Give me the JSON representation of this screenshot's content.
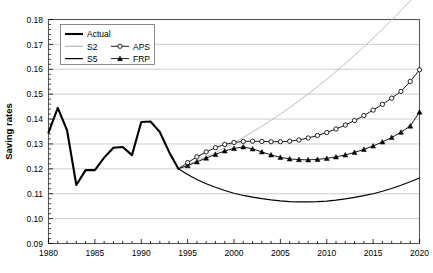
{
  "chart_data": {
    "type": "line",
    "title": "",
    "xlabel": "",
    "ylabel": "Saving rates",
    "xlim": [
      1980,
      2020
    ],
    "ylim": [
      0.09,
      0.18
    ],
    "xticks": [
      1980,
      1985,
      1990,
      1995,
      2000,
      2005,
      2010,
      2015,
      2020
    ],
    "xtick_labels": [
      "1980",
      "1985",
      "1990",
      "1995",
      "2000",
      "2005",
      "2010",
      "2015",
      "2020"
    ],
    "x_minor_tick_step": 1,
    "yticks": [
      0.09,
      0.1,
      0.11,
      0.12,
      0.13,
      0.14,
      0.15,
      0.16,
      0.17,
      0.18
    ],
    "ytick_labels": [
      "0.09",
      "0.10",
      "0.11",
      "0.12",
      "0.13",
      "0.14",
      "0.15",
      "0.16",
      "0.17",
      "0.18"
    ],
    "grid": "horizontal",
    "legend_position": "top-left",
    "series": [
      {
        "name": "Actual",
        "style": "thick-solid",
        "color": "#000000",
        "width": 2.1,
        "marker": "none",
        "x": [
          1980,
          1981,
          1982,
          1983,
          1984,
          1985,
          1986,
          1987,
          1988,
          1989,
          1990,
          1991,
          1992,
          1993,
          1994
        ],
        "y": [
          0.1345,
          0.1445,
          0.1355,
          0.1135,
          0.1195,
          0.1195,
          0.1245,
          0.1285,
          0.1288,
          0.1255,
          0.1388,
          0.139,
          0.1348,
          0.1268,
          0.12
        ]
      },
      {
        "name": "S2",
        "style": "thin-solid",
        "color": "#b4b4b4",
        "width": 0.9,
        "marker": "none",
        "x": [
          1994,
          1995,
          1996,
          1997,
          1998,
          1999,
          2000,
          2001,
          2002,
          2003,
          2004,
          2005,
          2006,
          2007,
          2008,
          2009,
          2010,
          2011,
          2012,
          2013,
          2014,
          2015,
          2016,
          2017,
          2018,
          2019,
          2020
        ],
        "y": [
          0.12,
          0.1215,
          0.1231,
          0.1248,
          0.1266,
          0.1285,
          0.1305,
          0.1326,
          0.1348,
          0.1371,
          0.1395,
          0.142,
          0.1446,
          0.1473,
          0.1501,
          0.153,
          0.156,
          0.1591,
          0.1623,
          0.1656,
          0.169,
          0.1725,
          0.1761,
          0.1798,
          0.1836,
          0.1875,
          0.1915
        ]
      },
      {
        "name": "S5",
        "style": "thin-solid",
        "color": "#000000",
        "width": 1.2,
        "marker": "none",
        "x": [
          1994,
          1995,
          1996,
          1997,
          1998,
          1999,
          2000,
          2001,
          2002,
          2003,
          2004,
          2005,
          2006,
          2007,
          2008,
          2009,
          2010,
          2011,
          2012,
          2013,
          2014,
          2015,
          2016,
          2017,
          2018,
          2019,
          2020
        ],
        "y": [
          0.12,
          0.1177,
          0.1157,
          0.114,
          0.1126,
          0.1113,
          0.1102,
          0.1093,
          0.1086,
          0.108,
          0.1075,
          0.1071,
          0.1068,
          0.1067,
          0.1067,
          0.1068,
          0.107,
          0.1074,
          0.1079,
          0.1085,
          0.1092,
          0.11,
          0.111,
          0.1121,
          0.1134,
          0.1148,
          0.1163
        ]
      },
      {
        "name": "APS",
        "style": "thin-solid-marker",
        "color": "#000000",
        "width": 0.9,
        "marker": "open-circle",
        "x": [
          1994,
          1995,
          1996,
          1997,
          1998,
          1999,
          2000,
          2001,
          2002,
          2003,
          2004,
          2005,
          2006,
          2007,
          2008,
          2009,
          2010,
          2011,
          2012,
          2013,
          2014,
          2015,
          2016,
          2017,
          2018,
          2019,
          2020
        ],
        "y": [
          0.12,
          0.1225,
          0.1248,
          0.1268,
          0.1285,
          0.1298,
          0.1306,
          0.131,
          0.1311,
          0.131,
          0.1309,
          0.1309,
          0.1311,
          0.1316,
          0.1324,
          0.1334,
          0.1346,
          0.136,
          0.1376,
          0.1394,
          0.1414,
          0.1436,
          0.1459,
          0.1484,
          0.1511,
          0.1551,
          0.1598
        ]
      },
      {
        "name": "FRP",
        "style": "thin-solid-marker",
        "color": "#000000",
        "width": 0.9,
        "marker": "filled-triangle",
        "x": [
          1994,
          1995,
          1996,
          1997,
          1998,
          1999,
          2000,
          2001,
          2002,
          2003,
          2004,
          2005,
          2006,
          2007,
          2008,
          2009,
          2010,
          2011,
          2012,
          2013,
          2014,
          2015,
          2016,
          2017,
          2018,
          2019,
          2020
        ],
        "y": [
          0.12,
          0.1213,
          0.1228,
          0.1243,
          0.1258,
          0.1272,
          0.1282,
          0.1288,
          0.128,
          0.1268,
          0.1256,
          0.1246,
          0.124,
          0.1237,
          0.1236,
          0.1238,
          0.1242,
          0.1248,
          0.1256,
          0.1266,
          0.1278,
          0.1292,
          0.1308,
          0.1326,
          0.1347,
          0.1372,
          0.1428
        ]
      }
    ],
    "legend": [
      {
        "label": "Actual",
        "style": "thick-solid",
        "color": "#000000",
        "marker": "none"
      },
      {
        "label": "S2",
        "style": "thin-solid",
        "color": "#b4b4b4",
        "marker": "none"
      },
      {
        "label": "APS",
        "style": "thin-solid-marker",
        "color": "#000000",
        "marker": "open-circle"
      },
      {
        "label": "S5",
        "style": "thin-solid",
        "color": "#000000",
        "marker": "none"
      },
      {
        "label": "FRP",
        "style": "thin-solid-marker",
        "color": "#000000",
        "marker": "filled-triangle"
      }
    ]
  }
}
